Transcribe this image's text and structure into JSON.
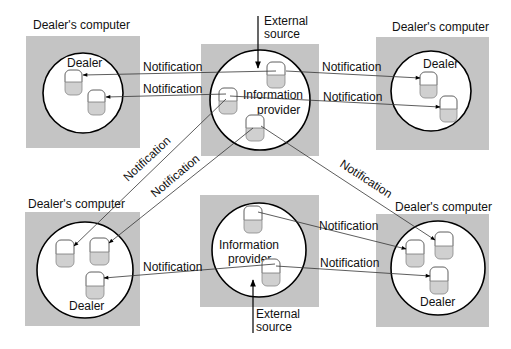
{
  "diagram": {
    "colors": {
      "box": "#c4c4c4",
      "circle_fill": "#ffffff",
      "db_fill": "#d0d0d0",
      "line": "#333333"
    },
    "nodes": {
      "dealer_tl": {
        "box_label": "Dealer's computer",
        "circle_label": "Dealer"
      },
      "dealer_tr": {
        "box_label": "Dealer's computer",
        "circle_label": "Dealer"
      },
      "dealer_bl": {
        "box_label": "Dealer's computer",
        "circle_label": "Dealer"
      },
      "dealer_br": {
        "box_label": "Dealer's computer",
        "circle_label": "Dealer"
      },
      "provider_top": {
        "circle_label_1": "Information",
        "circle_label_2": "provider",
        "source_1": "External",
        "source_2": "source"
      },
      "provider_bottom": {
        "circle_label_1": "Information",
        "circle_label_2": "provider",
        "source_1": "External",
        "source_2": "source"
      }
    },
    "edges": [
      {
        "label": "Notification"
      },
      {
        "label": "Notification"
      },
      {
        "label": "Notification"
      },
      {
        "label": "Notification"
      },
      {
        "label": "Notification"
      },
      {
        "label": "Notification"
      },
      {
        "label": "Notification"
      },
      {
        "label": "Notification"
      },
      {
        "label": "Notification"
      },
      {
        "label": "Notification"
      }
    ]
  }
}
